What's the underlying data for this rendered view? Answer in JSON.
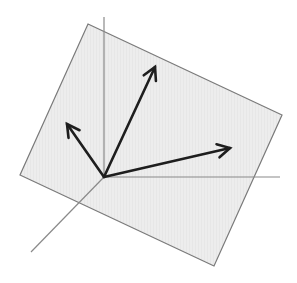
{
  "diagram": {
    "type": "vectors-on-plane",
    "canvas": {
      "width": 297,
      "height": 283,
      "background": "#ffffff"
    },
    "plane": {
      "points": [
        [
          88,
          24
        ],
        [
          282,
          115
        ],
        [
          214,
          266
        ],
        [
          20,
          175
        ]
      ],
      "fill": "#ececec",
      "stroke": "#7a7a7a"
    },
    "axes": {
      "origin": [
        104,
        177
      ],
      "color": "#8a8a8a",
      "lines": [
        {
          "name": "vertical-axis",
          "from": [
            104,
            177
          ],
          "to": [
            104,
            17
          ]
        },
        {
          "name": "horizontal-axis",
          "from": [
            104,
            177
          ],
          "to": [
            280,
            177
          ]
        },
        {
          "name": "diagonal-axis",
          "from": [
            104,
            177
          ],
          "to": [
            31,
            252
          ]
        }
      ]
    },
    "vectors": {
      "color": "#1e1e1e",
      "items": [
        {
          "name": "vector-up",
          "from": [
            104,
            177
          ],
          "to": [
            155,
            67
          ]
        },
        {
          "name": "vector-left",
          "from": [
            104,
            177
          ],
          "to": [
            67,
            124
          ]
        },
        {
          "name": "vector-right",
          "from": [
            104,
            177
          ],
          "to": [
            230,
            148
          ]
        }
      ]
    }
  }
}
